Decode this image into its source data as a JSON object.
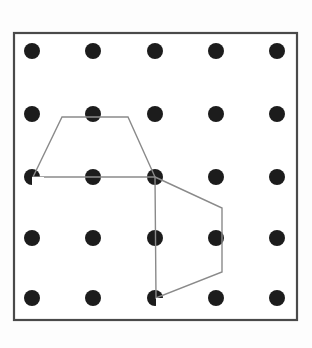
{
  "figure": {
    "name": "geoboard-polygon-figure",
    "canvas": {
      "width": 312,
      "height": 348
    },
    "background_color": "#fdfdfd"
  },
  "board": {
    "name": "geoboard-frame",
    "x": 14,
    "y": 33,
    "width": 283,
    "height": 287,
    "fill_color": "#ffffff",
    "border_color": "#4a4a4a",
    "border_width": 2.2
  },
  "pegs": {
    "name": "peg-grid",
    "rows": 5,
    "columns": 5,
    "radius": 8,
    "color": "#1c1c1c",
    "column_x": [
      32,
      93,
      155,
      216,
      277
    ],
    "row_y": [
      51,
      114,
      177,
      238,
      298
    ],
    "points": [
      {
        "row": 0,
        "col": 0,
        "x": 32,
        "y": 51
      },
      {
        "row": 0,
        "col": 1,
        "x": 93,
        "y": 51
      },
      {
        "row": 0,
        "col": 2,
        "x": 155,
        "y": 51
      },
      {
        "row": 0,
        "col": 3,
        "x": 216,
        "y": 51
      },
      {
        "row": 0,
        "col": 4,
        "x": 277,
        "y": 51
      },
      {
        "row": 1,
        "col": 0,
        "x": 32,
        "y": 114
      },
      {
        "row": 1,
        "col": 1,
        "x": 93,
        "y": 114
      },
      {
        "row": 1,
        "col": 2,
        "x": 155,
        "y": 114
      },
      {
        "row": 1,
        "col": 3,
        "x": 216,
        "y": 114
      },
      {
        "row": 1,
        "col": 4,
        "x": 277,
        "y": 114
      },
      {
        "row": 2,
        "col": 0,
        "x": 32,
        "y": 177
      },
      {
        "row": 2,
        "col": 1,
        "x": 93,
        "y": 177
      },
      {
        "row": 2,
        "col": 2,
        "x": 155,
        "y": 177
      },
      {
        "row": 2,
        "col": 3,
        "x": 216,
        "y": 177
      },
      {
        "row": 2,
        "col": 4,
        "x": 277,
        "y": 177
      },
      {
        "row": 3,
        "col": 0,
        "x": 32,
        "y": 238
      },
      {
        "row": 3,
        "col": 1,
        "x": 93,
        "y": 238
      },
      {
        "row": 3,
        "col": 2,
        "x": 155,
        "y": 238
      },
      {
        "row": 3,
        "col": 3,
        "x": 216,
        "y": 238
      },
      {
        "row": 3,
        "col": 4,
        "x": 277,
        "y": 238
      },
      {
        "row": 4,
        "col": 0,
        "x": 32,
        "y": 298
      },
      {
        "row": 4,
        "col": 1,
        "x": 93,
        "y": 298
      },
      {
        "row": 4,
        "col": 2,
        "x": 155,
        "y": 298
      },
      {
        "row": 4,
        "col": 3,
        "x": 216,
        "y": 298
      },
      {
        "row": 4,
        "col": 4,
        "x": 277,
        "y": 298
      }
    ]
  },
  "polygons": [
    {
      "name": "upper-trapezoid",
      "sides": 4,
      "stroke_color": "#8a8a8a",
      "stroke_width": 1.4,
      "closed": true,
      "points": "62,117 128,117 155,177 33,177",
      "vertices": [
        {
          "x": 62,
          "y": 117
        },
        {
          "x": 128,
          "y": 117
        },
        {
          "x": 155,
          "y": 177
        },
        {
          "x": 33,
          "y": 177
        }
      ]
    },
    {
      "name": "lower-quadrilateral",
      "sides": 4,
      "stroke_color": "#8a8a8a",
      "stroke_width": 1.4,
      "closed": true,
      "points": "155,177 222,208 222,272 156,298",
      "vertices": [
        {
          "x": 155,
          "y": 177
        },
        {
          "x": 222,
          "y": 208
        },
        {
          "x": 222,
          "y": 272
        },
        {
          "x": 156,
          "y": 298
        }
      ]
    }
  ],
  "notches": [
    {
      "name": "notch-left-vertex",
      "x": 32,
      "y": 177,
      "color": "#ffffff",
      "path": "M 32 177 L 44 177 L 44 187 L 32 187 Z"
    },
    {
      "name": "notch-bottom-vertex",
      "x": 156,
      "y": 298,
      "color": "#ffffff",
      "path": "M 156 298 L 168 298 L 168 307 L 156 307 Z"
    }
  ]
}
